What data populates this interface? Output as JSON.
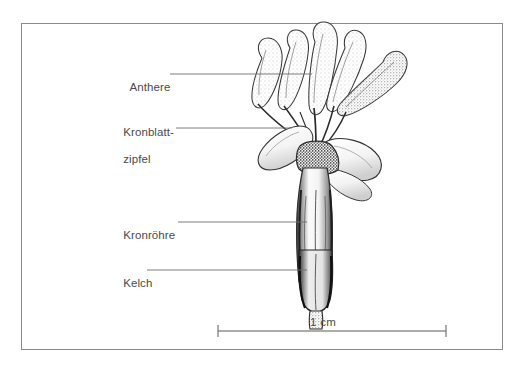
{
  "figure": {
    "kind": "botanical-line-drawing",
    "frame_visible": true
  },
  "labels": [
    {
      "id": "anthere",
      "text": "Anthere",
      "line2": ""
    },
    {
      "id": "kronblatt",
      "text": "Kronblatt-",
      "line2": "zipfel"
    },
    {
      "id": "kronroehre",
      "text": "Kronröhre",
      "line2": ""
    },
    {
      "id": "kelch",
      "text": "Kelch",
      "line2": ""
    }
  ],
  "scale_bar": {
    "caption": "1 cm"
  },
  "colors": {
    "frame": "#8a8a8a",
    "text": "#4a4a4a",
    "leader": "#6e6e6e",
    "ink": "#2b2b2b",
    "background": "#ffffff"
  }
}
